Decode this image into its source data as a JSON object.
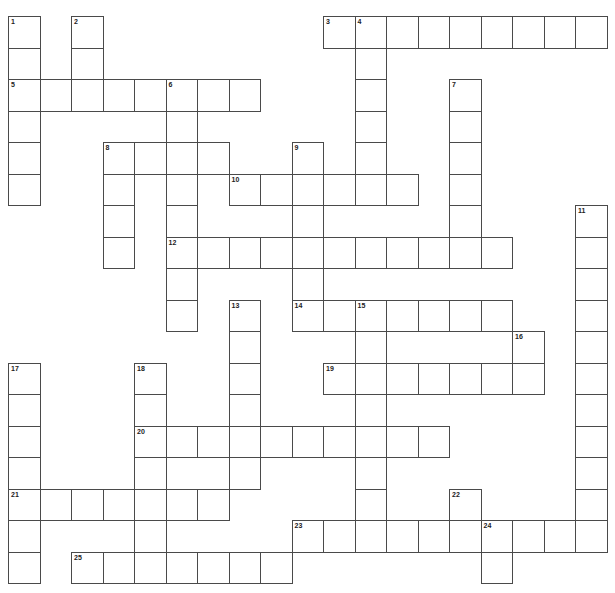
{
  "puzzle": {
    "type": "crossword",
    "grid": {
      "origin_x": 8,
      "origin_y": 16,
      "cell_size": 31.5,
      "columns": 19,
      "rows": 18
    },
    "colors": {
      "line": "#4a4a4a",
      "cell_fill": "#ffffff",
      "number": "#222222"
    },
    "entries": [
      {
        "number": "1",
        "direction": "down",
        "row": 0,
        "col": 0,
        "length": 6
      },
      {
        "number": "2",
        "direction": "down",
        "row": 0,
        "col": 2,
        "length": 2
      },
      {
        "number": "3",
        "direction": "across",
        "row": 0,
        "col": 10,
        "length": 9
      },
      {
        "number": "4",
        "direction": "down",
        "row": 0,
        "col": 11,
        "length": 6
      },
      {
        "number": "5",
        "direction": "across",
        "row": 2,
        "col": 0,
        "length": 8
      },
      {
        "number": "6",
        "direction": "down",
        "row": 2,
        "col": 5,
        "length": 8
      },
      {
        "number": "7",
        "direction": "down",
        "row": 2,
        "col": 14,
        "length": 6
      },
      {
        "number": "8",
        "direction": "across",
        "row": 4,
        "col": 3,
        "length": 4
      },
      {
        "number": "8",
        "direction": "down",
        "row": 4,
        "col": 3,
        "length": 4
      },
      {
        "number": "9",
        "direction": "down",
        "row": 4,
        "col": 9,
        "length": 6
      },
      {
        "number": "10",
        "direction": "across",
        "row": 5,
        "col": 7,
        "length": 6
      },
      {
        "number": "11",
        "direction": "down",
        "row": 6,
        "col": 18,
        "length": 11
      },
      {
        "number": "12",
        "direction": "across",
        "row": 7,
        "col": 5,
        "length": 11
      },
      {
        "number": "13",
        "direction": "down",
        "row": 9,
        "col": 7,
        "length": 6
      },
      {
        "number": "14",
        "direction": "across",
        "row": 9,
        "col": 9,
        "length": 7
      },
      {
        "number": "15",
        "direction": "down",
        "row": 9,
        "col": 11,
        "length": 8
      },
      {
        "number": "16",
        "direction": "down",
        "row": 10,
        "col": 16,
        "length": 2
      },
      {
        "number": "17",
        "direction": "down",
        "row": 11,
        "col": 0,
        "length": 7
      },
      {
        "number": "18",
        "direction": "down",
        "row": 11,
        "col": 4,
        "length": 7
      },
      {
        "number": "19",
        "direction": "across",
        "row": 11,
        "col": 10,
        "length": 7
      },
      {
        "number": "20",
        "direction": "across",
        "row": 13,
        "col": 4,
        "length": 10
      },
      {
        "number": "21",
        "direction": "across",
        "row": 15,
        "col": 0,
        "length": 7
      },
      {
        "number": "22",
        "direction": "down",
        "row": 15,
        "col": 14,
        "length": 2
      },
      {
        "number": "23",
        "direction": "across",
        "row": 16,
        "col": 9,
        "length": 10
      },
      {
        "number": "24",
        "direction": "down",
        "row": 16,
        "col": 15,
        "length": 2
      },
      {
        "number": "25",
        "direction": "across",
        "row": 17,
        "col": 2,
        "length": 7
      }
    ]
  }
}
